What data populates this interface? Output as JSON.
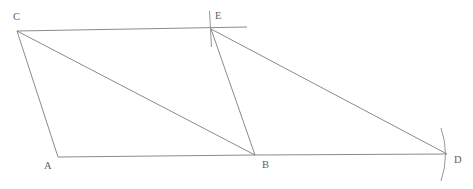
{
  "figure": {
    "kind": "geometry-diagram",
    "width": 473,
    "height": 189,
    "background_color": "#ffffff",
    "stroke_color": "#7d7d7d",
    "label_color": "#5f5f5f",
    "points": {
      "A": {
        "label": "A",
        "x": 58,
        "y": 157,
        "label_x": 44,
        "label_y": 161
      },
      "B": {
        "label": "B",
        "x": 255,
        "y": 155,
        "label_x": 262,
        "label_y": 160
      },
      "C": {
        "label": "C",
        "x": 17,
        "y": 31,
        "label_x": 13,
        "label_y": 12
      },
      "D": {
        "label": "D",
        "x": 447,
        "y": 154,
        "label_x": 454,
        "label_y": 155
      },
      "E": {
        "label": "E",
        "x": 211,
        "y": 29,
        "label_x": 215,
        "label_y": 11
      }
    },
    "segments": [
      {
        "name": "segment-CA",
        "from": "C",
        "to": "A"
      },
      {
        "name": "segment-CB",
        "from": "C",
        "to": "B"
      },
      {
        "name": "segment-CE",
        "from": "C",
        "to": "E"
      },
      {
        "name": "segment-AB",
        "from": "A",
        "to": "B"
      },
      {
        "name": "segment-BD",
        "from": "B",
        "to": "D"
      },
      {
        "name": "segment-EB",
        "from": "E",
        "to": "B"
      },
      {
        "name": "segment-ED",
        "from": "E",
        "to": "D"
      }
    ],
    "marks": [
      {
        "name": "tick-mark-at-E",
        "type": "tick",
        "at": "E"
      },
      {
        "name": "arc-mark-at-D",
        "type": "arc",
        "at": "D"
      },
      {
        "name": "line-extension-past-E",
        "type": "extension",
        "at": "E"
      }
    ]
  }
}
